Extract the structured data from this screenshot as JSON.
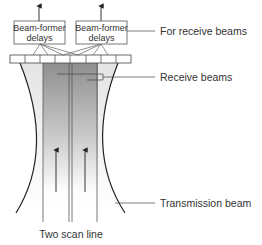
{
  "diagram": {
    "boxes": [
      {
        "line1": "Beam-former",
        "line2": "delays"
      },
      {
        "line1": "Beam-former",
        "line2": "delays"
      }
    ],
    "labels": {
      "for_receive": "For receive beams",
      "receive_beams": "Receive beams",
      "transmission_beam": "Transmission beam",
      "scan_line": "Two scan line"
    },
    "transducer_elements": 8,
    "colors": {
      "line": "#222222",
      "box_border": "#555555",
      "beam_dark": "#8a8a8a",
      "beam_light": "#ffffff",
      "text": "#333333"
    }
  }
}
